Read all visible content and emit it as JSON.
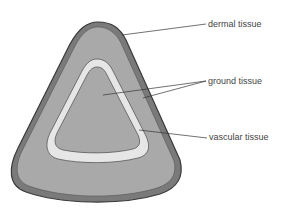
{
  "diagram": {
    "type": "plant stem cross-section",
    "labels": {
      "dermal": "dermal tissue",
      "ground": "ground tissue",
      "vascular": "vascular tissue"
    },
    "colors": {
      "dermal_fill": "#7a7a7a",
      "dermal_outline": "#3a3a3a",
      "ground_fill": "#a9a9a9",
      "vascular_fill": "#e6e6e6",
      "vascular_outline": "#4a4a4a",
      "leader_line": "#333333",
      "label_text": "#444444"
    }
  }
}
